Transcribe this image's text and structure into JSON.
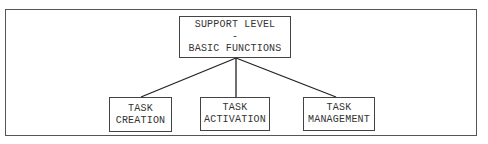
{
  "diagram": {
    "root": {
      "lines": [
        "SUPPORT LEVEL",
        "-",
        "BASIC FUNCTIONS"
      ]
    },
    "children": [
      {
        "lines": [
          "TASK",
          "CREATION"
        ]
      },
      {
        "lines": [
          "TASK",
          "ACTIVATION"
        ]
      },
      {
        "lines": [
          "TASK",
          "MANAGEMENT"
        ]
      }
    ],
    "colors": {
      "line": "#222222",
      "border": "#444444",
      "text": "#333333"
    }
  }
}
